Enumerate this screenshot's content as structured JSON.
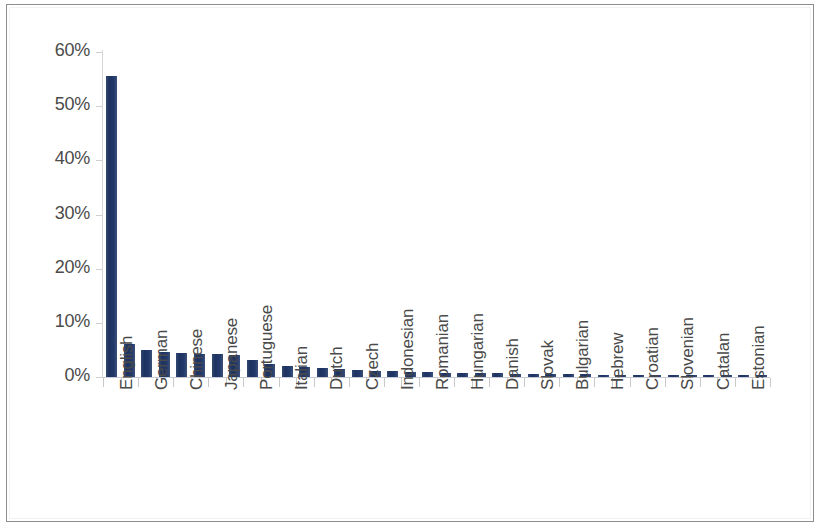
{
  "figure": {
    "border_color": "#8d8d8d",
    "background": "#ffffff"
  },
  "chart_data": {
    "type": "bar",
    "title": "",
    "subtitle": "",
    "xlabel": "",
    "ylabel": "",
    "ylim": [
      0,
      0.6
    ],
    "grid": false,
    "legend": null,
    "bar_color": "#22396a",
    "value_format": "percent",
    "y_ticks": [
      0,
      0.1,
      0.2,
      0.3,
      0.4,
      0.5,
      0.6
    ],
    "y_tick_labels": [
      "0%",
      "10%",
      "20%",
      "30%",
      "40%",
      "50%",
      "60%"
    ],
    "label_interval": 2,
    "categories": [
      "English",
      "",
      "German",
      "",
      "Chinese",
      "",
      "Japanese",
      "",
      "Portuguese",
      "",
      "Italian",
      "",
      "Dutch",
      "",
      "Czech",
      "",
      "Indonesian",
      "",
      "Romanian",
      "",
      "Hungarian",
      "",
      "Danish",
      "",
      "Slovak",
      "",
      "Bulgarian",
      "",
      "Hebrew",
      "",
      "Croatian",
      "",
      "Slovenian",
      "",
      "Catalan",
      "",
      "Estonian",
      ""
    ],
    "tick_labels": [
      "English",
      "German",
      "Chinese",
      "Japanese",
      "Portuguese",
      "Italian",
      "Dutch",
      "Czech",
      "Indonesian",
      "Romanian",
      "Hungarian",
      "Danish",
      "Slovak",
      "Bulgarian",
      "Hebrew",
      "Croatian",
      "Slovenian",
      "Catalan",
      "Estonian"
    ],
    "values": [
      0.555,
      0.061,
      0.05,
      0.047,
      0.045,
      0.043,
      0.042,
      0.041,
      0.031,
      0.024,
      0.02,
      0.018,
      0.016,
      0.015,
      0.013,
      0.012,
      0.011,
      0.01,
      0.009,
      0.008,
      0.008,
      0.007,
      0.007,
      0.006,
      0.006,
      0.005,
      0.005,
      0.005,
      0.004,
      0.004,
      0.004,
      0.004,
      0.003,
      0.003,
      0.003,
      0.003,
      0.003,
      0.002
    ]
  }
}
